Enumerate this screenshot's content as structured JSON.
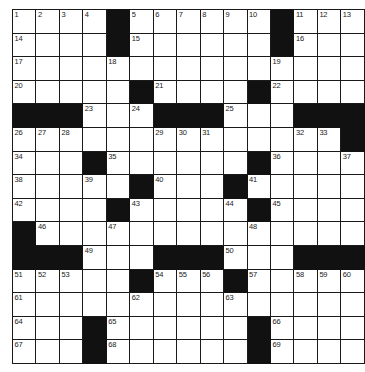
{
  "puzzle": {
    "type": "crossword-grid",
    "rows": 15,
    "cols": 15,
    "cell_size_px": 22.6,
    "colors": {
      "block": "#111111",
      "cell": "#ffffff",
      "line": "#1a1a1a",
      "number": "#1a1a1a",
      "background": "#ffffff"
    },
    "max_clue_number": 69,
    "grid": [
      [
        "1",
        "2",
        "3",
        "4",
        "#",
        "5",
        "6",
        "7",
        "8",
        "9",
        "10",
        "#",
        "11",
        "12",
        "13"
      ],
      [
        "14",
        "",
        "",
        "",
        "#",
        "15",
        "",
        "",
        "",
        "",
        "",
        "#",
        "16",
        "",
        ""
      ],
      [
        "17",
        "",
        "",
        "",
        "18",
        "",
        "",
        "",
        "",
        "",
        "",
        "19",
        "",
        "",
        ""
      ],
      [
        "20",
        "",
        "",
        "",
        "",
        "#",
        "21",
        "",
        "",
        "",
        "#",
        "22",
        "",
        "",
        ""
      ],
      [
        "#",
        "#",
        "#",
        "23",
        "",
        "24",
        "#",
        "#",
        "#",
        "25",
        "",
        "",
        "#",
        "#",
        "#"
      ],
      [
        "26",
        "27",
        "28",
        "",
        "",
        "",
        "29",
        "30",
        "31",
        "",
        "",
        "",
        "32",
        "33",
        "#"
      ],
      [
        "34",
        "",
        "",
        "#",
        "35",
        "",
        "",
        "",
        "",
        "",
        "#",
        "36",
        "",
        "",
        "37"
      ],
      [
        "38",
        "",
        "",
        "39",
        "",
        "#",
        "40",
        "",
        "",
        "#",
        "41",
        "",
        "",
        "",
        ""
      ],
      [
        "42",
        "",
        "",
        "",
        "#",
        "43",
        "",
        "",
        "",
        "44",
        "#",
        "45",
        "",
        "",
        ""
      ],
      [
        "#",
        "46",
        "",
        "",
        "47",
        "",
        "",
        "",
        "",
        "",
        "48",
        "",
        "",
        "",
        ""
      ],
      [
        "#",
        "#",
        "#",
        "49",
        "",
        "",
        "#",
        "#",
        "#",
        "50",
        "",
        "",
        "#",
        "#",
        "#"
      ],
      [
        "51",
        "52",
        "53",
        "",
        "",
        "#",
        "54",
        "55",
        "56",
        "#",
        "57",
        "",
        "58",
        "59",
        "60"
      ],
      [
        "61",
        "",
        "",
        "",
        "",
        "62",
        "",
        "",
        "",
        "63",
        "",
        "",
        "",
        "",
        ""
      ],
      [
        "64",
        "",
        "",
        "#",
        "65",
        "",
        "",
        "",
        "",
        "",
        "#",
        "66",
        "",
        "",
        ""
      ],
      [
        "67",
        "",
        "",
        "#",
        "68",
        "",
        "",
        "",
        "",
        "",
        "#",
        "69",
        "",
        "",
        ""
      ]
    ],
    "black_squares": [
      [
        0,
        4
      ],
      [
        0,
        11
      ],
      [
        1,
        4
      ],
      [
        1,
        11
      ],
      [
        3,
        5
      ],
      [
        3,
        10
      ],
      [
        4,
        0
      ],
      [
        4,
        1
      ],
      [
        4,
        2
      ],
      [
        4,
        6
      ],
      [
        4,
        7
      ],
      [
        4,
        8
      ],
      [
        4,
        12
      ],
      [
        4,
        13
      ],
      [
        4,
        14
      ],
      [
        5,
        14
      ],
      [
        6,
        3
      ],
      [
        6,
        10
      ],
      [
        7,
        5
      ],
      [
        7,
        9
      ],
      [
        8,
        4
      ],
      [
        8,
        10
      ],
      [
        9,
        0
      ],
      [
        10,
        0
      ],
      [
        10,
        1
      ],
      [
        10,
        2
      ],
      [
        10,
        6
      ],
      [
        10,
        7
      ],
      [
        10,
        8
      ],
      [
        10,
        12
      ],
      [
        10,
        13
      ],
      [
        10,
        14
      ],
      [
        11,
        5
      ],
      [
        11,
        9
      ],
      [
        13,
        3
      ],
      [
        13,
        10
      ],
      [
        14,
        3
      ],
      [
        14,
        10
      ]
    ],
    "numbered_cells": [
      {
        "n": "1",
        "row": 0,
        "col": 0
      },
      {
        "n": "2",
        "row": 0,
        "col": 1
      },
      {
        "n": "3",
        "row": 0,
        "col": 2
      },
      {
        "n": "4",
        "row": 0,
        "col": 3
      },
      {
        "n": "5",
        "row": 0,
        "col": 5
      },
      {
        "n": "6",
        "row": 0,
        "col": 6
      },
      {
        "n": "7",
        "row": 0,
        "col": 7
      },
      {
        "n": "8",
        "row": 0,
        "col": 8
      },
      {
        "n": "9",
        "row": 0,
        "col": 9
      },
      {
        "n": "10",
        "row": 0,
        "col": 10
      },
      {
        "n": "11",
        "row": 0,
        "col": 12
      },
      {
        "n": "12",
        "row": 0,
        "col": 13
      },
      {
        "n": "13",
        "row": 0,
        "col": 14
      },
      {
        "n": "14",
        "row": 1,
        "col": 0
      },
      {
        "n": "15",
        "row": 1,
        "col": 5
      },
      {
        "n": "16",
        "row": 1,
        "col": 12
      },
      {
        "n": "17",
        "row": 2,
        "col": 0
      },
      {
        "n": "18",
        "row": 2,
        "col": 4
      },
      {
        "n": "19",
        "row": 2,
        "col": 11
      },
      {
        "n": "20",
        "row": 3,
        "col": 0
      },
      {
        "n": "21",
        "row": 3,
        "col": 6
      },
      {
        "n": "22",
        "row": 3,
        "col": 11
      },
      {
        "n": "23",
        "row": 4,
        "col": 3
      },
      {
        "n": "24",
        "row": 4,
        "col": 5
      },
      {
        "n": "25",
        "row": 4,
        "col": 9
      },
      {
        "n": "26",
        "row": 5,
        "col": 0
      },
      {
        "n": "27",
        "row": 5,
        "col": 1
      },
      {
        "n": "28",
        "row": 5,
        "col": 2
      },
      {
        "n": "29",
        "row": 5,
        "col": 6
      },
      {
        "n": "30",
        "row": 5,
        "col": 7
      },
      {
        "n": "31",
        "row": 5,
        "col": 8
      },
      {
        "n": "32",
        "row": 5,
        "col": 12
      },
      {
        "n": "33",
        "row": 5,
        "col": 13
      },
      {
        "n": "34",
        "row": 6,
        "col": 0
      },
      {
        "n": "35",
        "row": 6,
        "col": 4
      },
      {
        "n": "36",
        "row": 6,
        "col": 11
      },
      {
        "n": "37",
        "row": 6,
        "col": 14
      },
      {
        "n": "38",
        "row": 7,
        "col": 0
      },
      {
        "n": "39",
        "row": 7,
        "col": 3
      },
      {
        "n": "40",
        "row": 7,
        "col": 6
      },
      {
        "n": "41",
        "row": 7,
        "col": 10
      },
      {
        "n": "42",
        "row": 8,
        "col": 0
      },
      {
        "n": "43",
        "row": 8,
        "col": 5
      },
      {
        "n": "44",
        "row": 8,
        "col": 9
      },
      {
        "n": "45",
        "row": 8,
        "col": 11
      },
      {
        "n": "46",
        "row": 9,
        "col": 1
      },
      {
        "n": "47",
        "row": 9,
        "col": 4
      },
      {
        "n": "48",
        "row": 9,
        "col": 10
      },
      {
        "n": "49",
        "row": 10,
        "col": 3
      },
      {
        "n": "50",
        "row": 10,
        "col": 9
      },
      {
        "n": "51",
        "row": 11,
        "col": 0
      },
      {
        "n": "52",
        "row": 11,
        "col": 1
      },
      {
        "n": "53",
        "row": 11,
        "col": 2
      },
      {
        "n": "54",
        "row": 11,
        "col": 6
      },
      {
        "n": "55",
        "row": 11,
        "col": 7
      },
      {
        "n": "56",
        "row": 11,
        "col": 8
      },
      {
        "n": "57",
        "row": 11,
        "col": 10
      },
      {
        "n": "58",
        "row": 11,
        "col": 12
      },
      {
        "n": "59",
        "row": 11,
        "col": 13
      },
      {
        "n": "60",
        "row": 11,
        "col": 14
      },
      {
        "n": "61",
        "row": 12,
        "col": 0
      },
      {
        "n": "62",
        "row": 12,
        "col": 5
      },
      {
        "n": "63",
        "row": 12,
        "col": 9
      },
      {
        "n": "64",
        "row": 13,
        "col": 0
      },
      {
        "n": "65",
        "row": 13,
        "col": 4
      },
      {
        "n": "66",
        "row": 13,
        "col": 11
      },
      {
        "n": "67",
        "row": 14,
        "col": 0
      },
      {
        "n": "68",
        "row": 14,
        "col": 4
      },
      {
        "n": "69",
        "row": 14,
        "col": 11
      }
    ]
  }
}
